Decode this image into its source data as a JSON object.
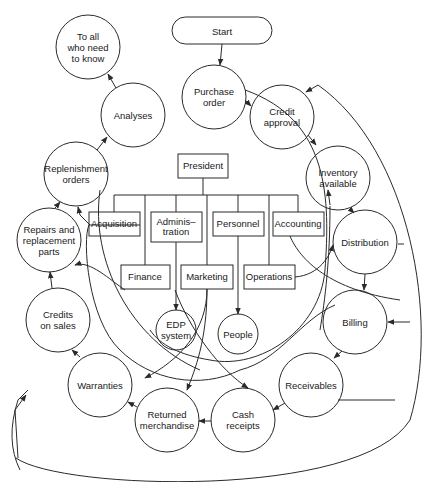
{
  "start": {
    "label": "Start"
  },
  "org_chart": {
    "top": {
      "label": "President"
    },
    "row1": [
      {
        "id": "acquisition",
        "label": "Acquisition"
      },
      {
        "id": "administration",
        "label": "Adminis–\ntration"
      },
      {
        "id": "personnel",
        "label": "Personnel"
      },
      {
        "id": "accounting",
        "label": "Accounting"
      }
    ],
    "row2": [
      {
        "id": "finance",
        "label": "Finance"
      },
      {
        "id": "marketing",
        "label": "Marketing"
      },
      {
        "id": "operations",
        "label": "Operations"
      }
    ]
  },
  "processes": [
    {
      "id": "to-all",
      "label": "To all\nwho need\nto know"
    },
    {
      "id": "analyses",
      "label": "Analyses"
    },
    {
      "id": "replenishment-orders",
      "label": "Replenishment\norders"
    },
    {
      "id": "repairs",
      "label": "Repairs and\nreplacement\nparts"
    },
    {
      "id": "credits-on-sales",
      "label": "Credits\non sales"
    },
    {
      "id": "warranties",
      "label": "Warranties"
    },
    {
      "id": "returned-merchandise",
      "label": "Returned\nmerchandise"
    },
    {
      "id": "cash-receipts",
      "label": "Cash\nreceipts"
    },
    {
      "id": "receivables",
      "label": "Receivables"
    },
    {
      "id": "billing",
      "label": "Billing"
    },
    {
      "id": "distribution",
      "label": "Distribution"
    },
    {
      "id": "inventory-available",
      "label": "Inventory\navailable"
    },
    {
      "id": "credit-approval",
      "label": "Credit\napproval"
    },
    {
      "id": "purchase-order",
      "label": "Purchase\norder"
    },
    {
      "id": "edp-system",
      "label": "EDP\nsystem"
    },
    {
      "id": "people",
      "label": "People"
    }
  ],
  "colors": {
    "stroke": "#2a2a2a",
    "background": "#ffffff",
    "text": "#1a1a1a"
  }
}
